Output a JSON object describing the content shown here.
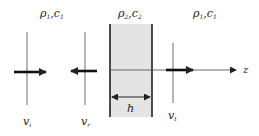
{
  "diagram": {
    "type": "layered-medium wave transmission",
    "media": [
      {
        "id": "left",
        "density_symbol": "ρ",
        "density_sub": "1",
        "speed_symbol": "c",
        "speed_sub": "1"
      },
      {
        "id": "slab",
        "density_symbol": "ρ",
        "density_sub": "2",
        "speed_symbol": "c",
        "speed_sub": "2"
      },
      {
        "id": "right",
        "density_symbol": "ρ",
        "density_sub": "1",
        "speed_symbol": "c",
        "speed_sub": "1"
      }
    ],
    "waves": [
      {
        "id": "incident",
        "symbol": "v",
        "sub": "i",
        "direction": "right"
      },
      {
        "id": "reflected",
        "symbol": "v",
        "sub": "r",
        "direction": "left"
      },
      {
        "id": "transmitted",
        "symbol": "v",
        "sub": "t",
        "direction": "right"
      }
    ],
    "thickness_label": "h",
    "axis_label": "z",
    "colors": {
      "slab_fill": "#e4e4e4",
      "line": "#222222"
    }
  }
}
